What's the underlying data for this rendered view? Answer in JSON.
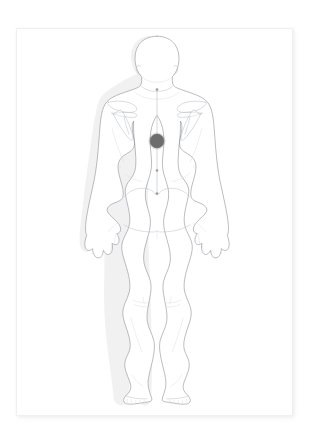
{
  "page": {
    "title": "Posterior Body Pain Location Chart",
    "background_color": "#ffffff",
    "card_background": "#ffffff",
    "card_border_color": "#f0f0f0"
  },
  "figure": {
    "view_label": "Posterior view",
    "orientation": "back",
    "outline_color": "#8f949a",
    "inner_line_color": "#b9bec4",
    "bone_line_color": "#b4b9bf",
    "shadow_color": "#000000"
  },
  "midline": {
    "label": "Spinal midline guide",
    "color": "#b2b7bd",
    "tick_color": "#9a9fa5",
    "ticks": 4
  },
  "marker": {
    "label": "Pain location marker",
    "region": "Upper mid back (interscapular)",
    "color": "#6d6d6d",
    "x": 157,
    "y": 141,
    "radius": 7
  },
  "landmarks": [
    {
      "name": "head",
      "label": "Head"
    },
    {
      "name": "left-ear",
      "label": "Left ear"
    },
    {
      "name": "right-ear",
      "label": "Right ear"
    },
    {
      "name": "neck",
      "label": "Neck"
    },
    {
      "name": "left-scapula",
      "label": "Left scapula"
    },
    {
      "name": "right-scapula",
      "label": "Right scapula"
    },
    {
      "name": "left-arm",
      "label": "Left arm"
    },
    {
      "name": "right-arm",
      "label": "Right arm"
    },
    {
      "name": "left-hand",
      "label": "Left hand"
    },
    {
      "name": "right-hand",
      "label": "Right hand"
    },
    {
      "name": "gluteal-fold",
      "label": "Gluteal fold"
    },
    {
      "name": "left-leg",
      "label": "Left leg"
    },
    {
      "name": "right-leg",
      "label": "Right leg"
    },
    {
      "name": "left-foot",
      "label": "Left foot"
    },
    {
      "name": "right-foot",
      "label": "Right foot"
    }
  ]
}
